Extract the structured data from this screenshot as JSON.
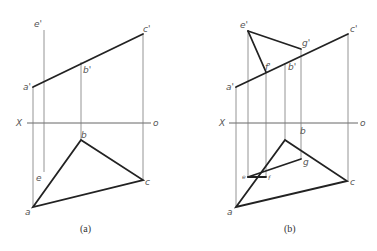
{
  "figure": {
    "panels": [
      {
        "id": "a",
        "caption": "(a)",
        "axis": {
          "left_label": "X",
          "right_label": "o"
        },
        "labels": {
          "e_prime": "e'",
          "c_prime": "c'",
          "b_prime": "b'",
          "a_prime": "a'",
          "b": "b",
          "c": "c",
          "a": "a",
          "e": "e"
        }
      },
      {
        "id": "b",
        "caption": "(b)",
        "axis": {
          "left_label": "X",
          "right_label": "o"
        },
        "labels": {
          "e_prime": "e'",
          "g_prime": "g'",
          "c_prime": "c'",
          "f_prime": "f'",
          "b_prime": "b'",
          "a_prime": "a'",
          "b": "b",
          "g": "g",
          "e": "e",
          "f": "f",
          "c": "c",
          "a": "a"
        }
      }
    ]
  }
}
